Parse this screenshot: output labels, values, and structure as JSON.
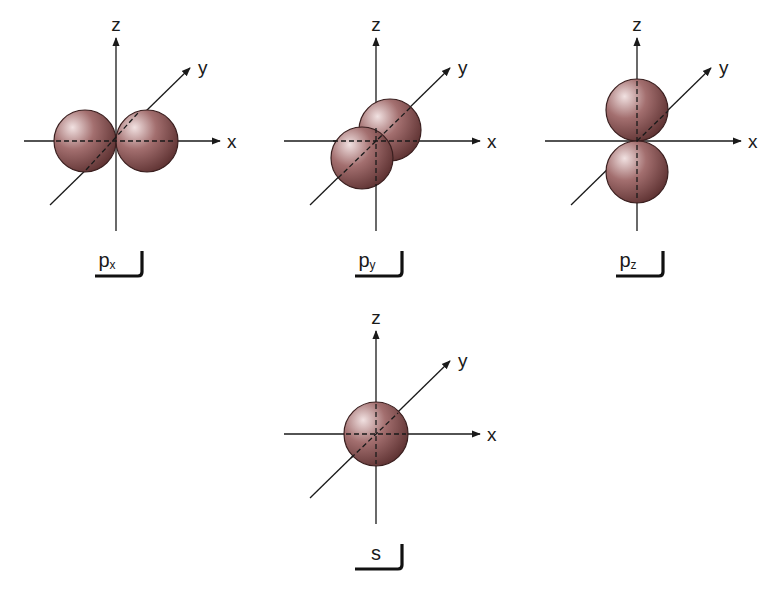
{
  "axis_labels": {
    "x": "x",
    "y": "y",
    "z": "z"
  },
  "colors": {
    "sphere_highlight": "#f1e1e1",
    "sphere_mid": "#a36f6f",
    "sphere_dark": "#5e3232",
    "sphere_outline": "#3a1f1f",
    "axis": "#1a1a1a"
  },
  "panels": [
    {
      "id": "px",
      "label_main": "p",
      "label_sub": "x",
      "orientation": "x",
      "lobes": 2
    },
    {
      "id": "py",
      "label_main": "p",
      "label_sub": "y",
      "orientation": "y",
      "lobes": 2
    },
    {
      "id": "pz",
      "label_main": "p",
      "label_sub": "z",
      "orientation": "z",
      "lobes": 2
    },
    {
      "id": "s",
      "label_main": "s",
      "label_sub": "",
      "orientation": "none",
      "lobes": 1
    }
  ]
}
